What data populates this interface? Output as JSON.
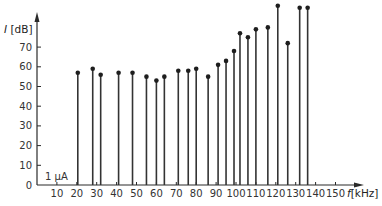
{
  "chart_data": {
    "type": "stem",
    "title": "",
    "xlabel": "f [kHz]",
    "ylabel": "I [dB]",
    "xlabel_italic_part": "f",
    "xlabel_unit": "[kHz]",
    "ylabel_italic_part": "I",
    "ylabel_unit": "[dB]",
    "xlim": [
      0,
      160
    ],
    "ylim": [
      0,
      80
    ],
    "x_ticks": [
      10,
      20,
      30,
      40,
      50,
      60,
      70,
      80,
      90,
      100,
      110,
      120,
      130,
      140,
      150
    ],
    "y_ticks": [
      0,
      10,
      20,
      30,
      40,
      50,
      60,
      70
    ],
    "grid": false,
    "annotations": [
      {
        "text": "1 µA",
        "x": 3,
        "y": 4
      }
    ],
    "x": [
      20.5,
      28,
      32,
      41,
      48,
      55,
      60,
      64,
      71,
      76,
      80,
      86,
      91,
      95,
      99,
      102,
      106,
      110,
      116,
      121,
      126,
      132,
      136
    ],
    "values": [
      57,
      59,
      56,
      57,
      57,
      55,
      53,
      55,
      58,
      58,
      59,
      55,
      61,
      63,
      68,
      77,
      75,
      79,
      80,
      91,
      72,
      90,
      90
    ]
  }
}
